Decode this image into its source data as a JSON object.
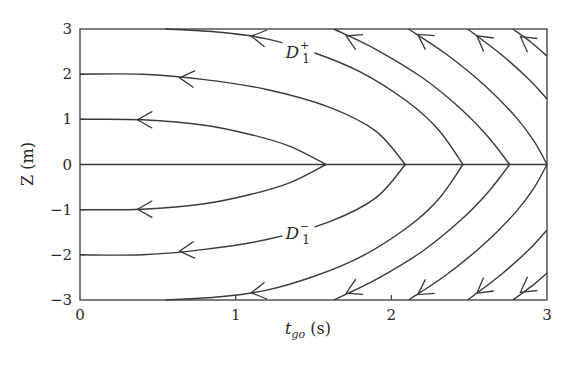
{
  "chart_data": {
    "type": "line",
    "title": "",
    "xlabel": "t_go (s)",
    "ylabel": "Z (m)",
    "xlim": [
      0,
      3
    ],
    "ylim": [
      -3,
      3
    ],
    "xticks": [
      0,
      1,
      2,
      3
    ],
    "yticks": [
      -3,
      -2,
      -1,
      0,
      1,
      2,
      3
    ],
    "grid": false,
    "legend": null,
    "annotations": [
      {
        "text": "D1+",
        "base": "D",
        "sub": "1",
        "sup": "+",
        "t": 1.32,
        "z": 2.45
      },
      {
        "text": "D1-",
        "base": "D",
        "sub": "1",
        "sup": "−",
        "t": 1.32,
        "z": -1.55
      }
    ],
    "series": [
      {
        "name": "upper-Z0=1",
        "points": [
          [
            0,
            1
          ],
          [
            0.4,
            0.99
          ],
          [
            0.8,
            0.87
          ],
          [
            1.1,
            0.66
          ],
          [
            1.35,
            0.4
          ],
          [
            1.58,
            0
          ]
        ],
        "arrow": [
          0.37,
          0.99
        ]
      },
      {
        "name": "upper-Z0=2",
        "points": [
          [
            0,
            2
          ],
          [
            0.4,
            2.0
          ],
          [
            0.8,
            1.88
          ],
          [
            1.2,
            1.66
          ],
          [
            1.6,
            1.27
          ],
          [
            1.9,
            0.74
          ],
          [
            2.09,
            0
          ]
        ],
        "arrow": [
          0.64,
          1.92
        ]
      },
      {
        "name": "upper-Z0=3",
        "points": [
          [
            0.55,
            3
          ],
          [
            0.9,
            2.93
          ],
          [
            1.2,
            2.78
          ],
          [
            1.5,
            2.48
          ],
          [
            1.8,
            2.05
          ],
          [
            2.1,
            1.4
          ],
          [
            2.3,
            0.78
          ],
          [
            2.46,
            0
          ]
        ],
        "arrow": [
          1.1,
          2.84
        ]
      },
      {
        "name": "upper-4",
        "points": [
          [
            1.63,
            3
          ],
          [
            1.9,
            2.55
          ],
          [
            2.2,
            1.92
          ],
          [
            2.45,
            1.22
          ],
          [
            2.62,
            0.62
          ],
          [
            2.76,
            0
          ]
        ],
        "arrow": [
          1.71,
          2.85
        ]
      },
      {
        "name": "upper-5",
        "points": [
          [
            2.11,
            3
          ],
          [
            2.35,
            2.45
          ],
          [
            2.6,
            1.75
          ],
          [
            2.8,
            1.05
          ],
          [
            2.92,
            0.5
          ],
          [
            3.0,
            0
          ]
        ],
        "arrow": [
          2.17,
          2.88
        ]
      },
      {
        "name": "upper-6",
        "points": [
          [
            2.49,
            3
          ],
          [
            2.7,
            2.45
          ],
          [
            2.88,
            1.9
          ],
          [
            3.0,
            1.45
          ]
        ],
        "arrow": [
          2.55,
          2.85
        ]
      },
      {
        "name": "upper-7",
        "points": [
          [
            2.78,
            3
          ],
          [
            2.9,
            2.7
          ],
          [
            3.0,
            2.4
          ]
        ],
        "arrow": [
          2.83,
          2.83
        ]
      },
      {
        "name": "lower-Z0=-1",
        "points": [
          [
            0,
            -1
          ],
          [
            0.4,
            -0.99
          ],
          [
            0.8,
            -0.87
          ],
          [
            1.1,
            -0.66
          ],
          [
            1.35,
            -0.4
          ],
          [
            1.58,
            0
          ]
        ],
        "arrow": [
          0.37,
          -0.99
        ]
      },
      {
        "name": "lower-Z0=-2",
        "points": [
          [
            0,
            -2
          ],
          [
            0.4,
            -2.0
          ],
          [
            0.8,
            -1.88
          ],
          [
            1.2,
            -1.66
          ],
          [
            1.6,
            -1.27
          ],
          [
            1.9,
            -0.74
          ],
          [
            2.09,
            0
          ]
        ],
        "arrow": [
          0.64,
          -1.92
        ]
      },
      {
        "name": "lower-Z0=-3",
        "points": [
          [
            0.55,
            -3
          ],
          [
            0.9,
            -2.93
          ],
          [
            1.2,
            -2.78
          ],
          [
            1.5,
            -2.48
          ],
          [
            1.8,
            -2.05
          ],
          [
            2.1,
            -1.4
          ],
          [
            2.3,
            -0.78
          ],
          [
            2.46,
            0
          ]
        ],
        "arrow": [
          1.1,
          -2.84
        ]
      },
      {
        "name": "lower-4",
        "points": [
          [
            1.63,
            -3
          ],
          [
            1.9,
            -2.55
          ],
          [
            2.2,
            -1.92
          ],
          [
            2.45,
            -1.22
          ],
          [
            2.62,
            -0.62
          ],
          [
            2.76,
            0
          ]
        ],
        "arrow": [
          1.71,
          -2.85
        ]
      },
      {
        "name": "lower-5",
        "points": [
          [
            2.11,
            -3
          ],
          [
            2.35,
            -2.45
          ],
          [
            2.6,
            -1.75
          ],
          [
            2.8,
            -1.05
          ],
          [
            2.92,
            -0.5
          ],
          [
            3.0,
            0
          ]
        ],
        "arrow": [
          2.17,
          -2.88
        ]
      },
      {
        "name": "lower-6",
        "points": [
          [
            2.49,
            -3
          ],
          [
            2.7,
            -2.45
          ],
          [
            2.88,
            -1.9
          ],
          [
            3.0,
            -1.45
          ]
        ],
        "arrow": [
          2.55,
          -2.85
        ]
      },
      {
        "name": "lower-7",
        "points": [
          [
            2.78,
            -3
          ],
          [
            2.9,
            -2.7
          ],
          [
            3.0,
            -2.4
          ]
        ],
        "arrow": [
          2.83,
          -2.83
        ]
      }
    ],
    "zero_line": {
      "t_start": 0,
      "t_end": 3,
      "z": 0
    }
  },
  "labels": {
    "xlabel_base": "t",
    "xlabel_sub": "go",
    "xlabel_unit": " (s)",
    "ylabel": "Z (m)"
  }
}
